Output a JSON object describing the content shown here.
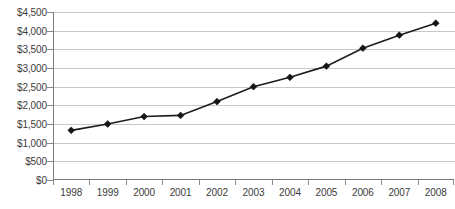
{
  "chart_data": {
    "type": "line",
    "title": "",
    "subtitle": "",
    "xlabel": "",
    "ylabel": "",
    "categories": [
      "1998",
      "1999",
      "2000",
      "2001",
      "2002",
      "2003",
      "2004",
      "2005",
      "2006",
      "2007",
      "2008"
    ],
    "values": [
      1330,
      1500,
      1700,
      1730,
      2100,
      2500,
      2750,
      3050,
      3530,
      3880,
      4200
    ],
    "series": [
      {
        "name": "",
        "values": [
          1330,
          1500,
          1700,
          1730,
          2100,
          2500,
          2750,
          3050,
          3530,
          3880,
          4200
        ]
      }
    ],
    "ylim": [
      0,
      4500
    ],
    "ytick_step": 500,
    "ytick_labels": [
      "$0",
      "$500",
      "$1,000",
      "$1,500",
      "$2,000",
      "$2,500",
      "$3,000",
      "$3,500",
      "$4,000",
      "$4,500"
    ],
    "ytick_values": [
      0,
      500,
      1000,
      1500,
      2000,
      2500,
      3000,
      3500,
      4000,
      4500
    ],
    "xtick_labels": [
      "1998",
      "1999",
      "2000",
      "2001",
      "2002",
      "2003",
      "2004",
      "2005",
      "2006",
      "2007",
      "2008"
    ],
    "grid": true,
    "grid_axis": "y",
    "legend": false,
    "legend_position": "none",
    "marker": "diamond",
    "line_color": "#1c1c1c",
    "marker_color": "#141414",
    "grid_color": "#c8c8c8",
    "axis_color": "#7a7a7a",
    "text_color": "#3c3c3c",
    "background_color": "#ffffff"
  }
}
